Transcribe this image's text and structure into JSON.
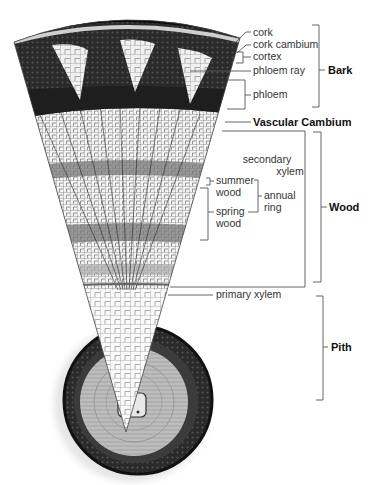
{
  "diagram": {
    "labels": {
      "cork": "cork",
      "cork_cambium": "cork cambium",
      "cortex": "cortex",
      "phloem_ray": "phloem ray",
      "phloem": "phloem",
      "vascular_cambium": "Vascular Cambium",
      "secondary_xylem_1": "secondary",
      "secondary_xylem_2": "xylem",
      "summer_wood_1": "summer",
      "summer_wood_2": "wood",
      "spring_wood_1": "spring",
      "spring_wood_2": "wood",
      "annual_ring_1": "annual",
      "annual_ring_2": "ring",
      "primary_xylem": "primary xylem"
    },
    "groups": {
      "bark": "Bark",
      "wood": "Wood",
      "pith": "Pith"
    },
    "colors": {
      "bark_dark": "#1a1a1a",
      "phloem_mid": "#3a3a3a",
      "xylem_light": "#d8d8d8",
      "pith_light": "#f2f2f2",
      "lines": "#555555"
    }
  }
}
